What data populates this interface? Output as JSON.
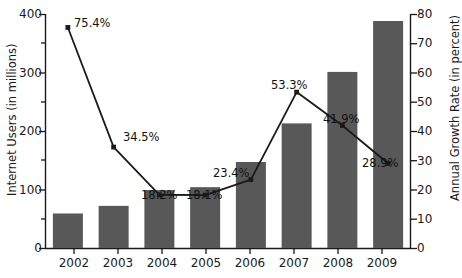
{
  "chart_data": {
    "type": "bar",
    "title": "",
    "subtitle": "",
    "categories": [
      "2002",
      "2003",
      "2004",
      "2005",
      "2006",
      "2007",
      "2008",
      "2009"
    ],
    "xlabel": "",
    "ylabel": "Internet Users (in millions)",
    "ylabel_right": "Annual Growth Rate (in percent)",
    "ylim": [
      0,
      400
    ],
    "ylim_right": [
      0,
      80
    ],
    "yticks": [
      0,
      100,
      200,
      300,
      400
    ],
    "yticks_right": [
      0,
      10,
      20,
      30,
      40,
      50,
      60,
      70,
      80
    ],
    "yticks_minor": [
      50,
      150,
      250,
      350
    ],
    "grid": false,
    "legend": "none",
    "series": [
      {
        "name": "Internet Users (in millions)",
        "type": "bar",
        "axis": "left",
        "color": "#585858",
        "values": [
          59,
          72,
          99,
          104,
          147,
          213,
          301,
          388
        ]
      },
      {
        "name": "Annual Growth Rate (in percent)",
        "type": "line",
        "axis": "right",
        "color": "#1a1a1a",
        "marker": "square",
        "values": [
          75.4,
          34.5,
          18.2,
          18.1,
          23.4,
          53.3,
          41.9,
          28.9
        ],
        "data_labels": [
          "75.4%",
          "34.5%",
          "18.2%",
          "18.1%",
          "23.4%",
          "53.3%",
          "41.9%",
          "28.9%"
        ]
      }
    ]
  },
  "axis": {
    "left_title": "Internet Users (in millions)",
    "right_title": "Annual Growth Rate (in percent)",
    "left_ticks": [
      "0",
      "100",
      "200",
      "300",
      "400"
    ],
    "right_ticks": [
      "0",
      "10",
      "20",
      "30",
      "40",
      "50",
      "60",
      "70",
      "80"
    ],
    "x_ticks": [
      "2002",
      "2003",
      "2004",
      "2005",
      "2006",
      "2007",
      "2008",
      "2009"
    ]
  },
  "labels": {
    "d0": "75.4%",
    "d1": "34.5%",
    "d2": "18.2%",
    "d3": "18.1%",
    "d4": "23.4%",
    "d5": "53.3%",
    "d6": "41.9%",
    "d7": "28.9%"
  },
  "colors": {
    "bar": "#585858",
    "line": "#1a1a1a",
    "axis": "#1a1a1a",
    "background": "#ffffff",
    "text": "#1a1a1a"
  }
}
